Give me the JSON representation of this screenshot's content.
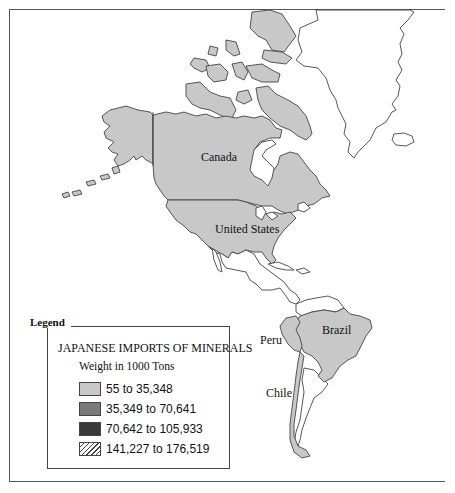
{
  "map": {
    "countries": [
      {
        "name": "Canada",
        "category": 1
      },
      {
        "name": "United States",
        "category": 1
      },
      {
        "name": "Brazil",
        "category": 1
      },
      {
        "name": "Peru",
        "category": 1
      },
      {
        "name": "Chile",
        "category": 1
      }
    ],
    "labels": {
      "canada": "Canada",
      "united_states": "United States",
      "brazil": "Brazil",
      "peru": "Peru",
      "chile": "Chile"
    }
  },
  "legend": {
    "title": "Legend",
    "heading": "JAPANESE IMPORTS OF MINERALS",
    "subheading": "Weight in 1000 Tons",
    "items": [
      {
        "label": "55 to 35,348",
        "color": "#c8c8c8",
        "pattern": "solid"
      },
      {
        "label": "35,349 to 70,641",
        "color": "#7a7a7a",
        "pattern": "solid"
      },
      {
        "label": "70,642 to 105,933",
        "color": "#3a3a3a",
        "pattern": "solid"
      },
      {
        "label": "141,227 to 176,519",
        "color": "#ffffff",
        "pattern": "hatch"
      }
    ]
  }
}
